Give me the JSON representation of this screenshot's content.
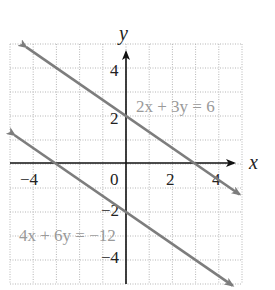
{
  "chart_data": {
    "type": "line",
    "title": "",
    "xlabel": "x",
    "ylabel": "y",
    "xlim": [
      -5,
      5
    ],
    "ylim": [
      -5,
      5
    ],
    "grid": true,
    "x_ticks": [
      -4,
      0,
      2,
      4
    ],
    "x_tick_labels": [
      "−4",
      "0",
      "2",
      "4"
    ],
    "y_ticks": [
      4,
      2,
      -2,
      -4
    ],
    "y_tick_labels": [
      "4",
      "2",
      "−2",
      "−4"
    ],
    "series": [
      {
        "name": "2x + 3y = 6",
        "equation": "2x + 3y = 6",
        "slope": -0.6667,
        "intercept": 2,
        "x": [
          -4.3,
          4.9
        ],
        "y": [
          4.87,
          -1.27
        ],
        "arrows": "both"
      },
      {
        "name": "4x + 6y = −12",
        "equation": "4x + 6y = −12",
        "slope": -0.6667,
        "intercept": -2,
        "x": [
          -4.8,
          4.6
        ],
        "y": [
          1.2,
          -5.07
        ],
        "arrows": "both"
      }
    ],
    "annotations": [
      {
        "text": "2x + 3y = 6",
        "x": 0.5,
        "y": 2.4
      },
      {
        "text": "4x + 6y = −12",
        "x": -4.6,
        "y": -3.2
      }
    ]
  },
  "labels": {
    "x_axis": "x",
    "y_axis": "y",
    "eq1": "2x + 3y = 6",
    "eq2": "4x + 6y = −12",
    "tick_x_neg4": "−4",
    "tick_x_0": "0",
    "tick_x_2": "2",
    "tick_x_4": "4",
    "tick_y_4": "4",
    "tick_y_2": "2",
    "tick_y_neg2": "−2",
    "tick_y_neg4": "−4"
  },
  "colors": {
    "line": "#7d7d7d",
    "axis": "#111111",
    "grid": "#b5b5b5",
    "equation_text": "#9a9a9a"
  }
}
